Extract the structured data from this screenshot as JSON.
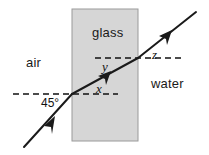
{
  "diagram": {
    "media": {
      "air": "air",
      "glass": "glass",
      "water": "water"
    },
    "angles": {
      "incidence": "45°",
      "x": "x",
      "y": "y",
      "z": "z"
    },
    "colors": {
      "slab_fill": "#d6d6d6",
      "slab_border": "#9a9a9a",
      "ray": "#1a1a1a",
      "normal_dash": "#111111",
      "background": "#ffffff",
      "text": "#111111"
    },
    "geometry": {
      "slab_left_x": 72,
      "slab_right_x": 138,
      "slab_top_y": 9,
      "slab_bottom_y": 141,
      "entry_point": [
        72,
        94
      ],
      "exit_point": [
        138,
        58
      ],
      "ray_start": [
        24,
        147
      ],
      "ray_end": [
        196,
        12
      ],
      "normal_left_from_x": 13,
      "normal_left_to_x": 118,
      "normal_left_y": 94,
      "normal_right_from_x": 95,
      "normal_right_to_x": 181,
      "normal_right_y": 58
    }
  }
}
